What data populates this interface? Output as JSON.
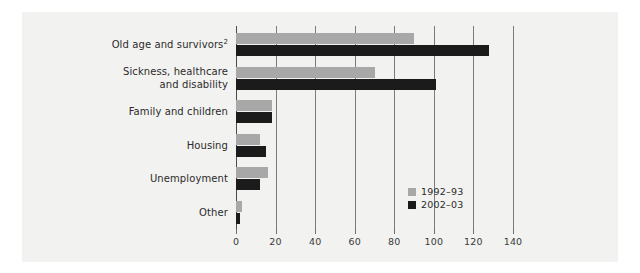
{
  "chart_data": {
    "type": "bar",
    "orientation": "horizontal",
    "title": "",
    "xlabel": "",
    "ylabel": "",
    "xlim": [
      0,
      140
    ],
    "xticks": [
      0,
      20,
      40,
      60,
      80,
      100,
      120,
      140
    ],
    "grid": true,
    "legend_position": "inside-bottom-right",
    "categories": [
      "Old age and survivors²",
      "Sickness, healthcare\nand disability",
      "Family and children",
      "Housing",
      "Unemployment",
      "Other"
    ],
    "series": [
      {
        "name": "1992–93",
        "color": "#a8a8a8",
        "values": [
          90,
          70,
          18,
          12,
          16,
          3
        ]
      },
      {
        "name": "2002–03",
        "color": "#1b1b1b",
        "values": [
          128,
          101,
          18,
          15,
          12,
          2
        ]
      }
    ]
  },
  "axis": {
    "tick_labels": [
      "0",
      "20",
      "40",
      "60",
      "80",
      "100",
      "120",
      "140"
    ]
  },
  "categories_display": [
    {
      "line1": "Old age and survivors",
      "sup": "2",
      "line2": ""
    },
    {
      "line1": "Sickness, healthcare",
      "sup": "",
      "line2": "and disability"
    },
    {
      "line1": "Family and children",
      "sup": "",
      "line2": ""
    },
    {
      "line1": "Housing",
      "sup": "",
      "line2": ""
    },
    {
      "line1": "Unemployment",
      "sup": "",
      "line2": ""
    },
    {
      "line1": "Other",
      "sup": "",
      "line2": ""
    }
  ],
  "legend": {
    "items": [
      {
        "label": "1992–93",
        "color": "#a8a8a8"
      },
      {
        "label": "2002–03",
        "color": "#1b1b1b"
      }
    ]
  },
  "colors": {
    "panel_background": "#f2f2f0",
    "series_1992": "#a8a8a8",
    "series_2002": "#1b1b1b",
    "gridline": "#7b7b7b",
    "text": "#2b2b2b"
  }
}
